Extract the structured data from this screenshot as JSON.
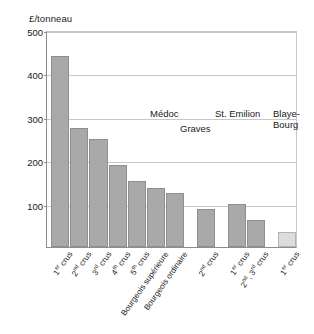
{
  "chart_data": {
    "type": "bar",
    "title": "",
    "ylabel": "£/tonneau",
    "xlabel": "",
    "ylim": [
      0,
      500
    ],
    "yticks": [
      100,
      200,
      300,
      400,
      500
    ],
    "grid": true,
    "legend": "none",
    "categories": [
      "1er crus",
      "2nd crus",
      "3rd crus",
      "4th crus",
      "5th crus",
      "Bourgeois supérieure",
      "Bourgeois ordinaire",
      "2nd crus",
      "1er crus",
      "2nd, 3rd crus",
      "1er crus"
    ],
    "values": [
      440,
      275,
      250,
      190,
      152,
      137,
      125,
      88,
      100,
      62,
      35
    ],
    "groups": [
      {
        "name": "Médoc",
        "bars": 7
      },
      {
        "name": "Graves",
        "bars": 1
      },
      {
        "name": "St. Emilion",
        "bars": 2
      },
      {
        "name": "Blaye-Bourg",
        "bars": 1
      }
    ],
    "annotations": [
      {
        "text": "Médoc"
      },
      {
        "text": "Graves"
      },
      {
        "text": "St. Emilion"
      },
      {
        "text": "Blaye-",
        "text2": "Bourg"
      }
    ]
  },
  "axis": {
    "y_title": "£/tonneau",
    "ticks": [
      "500",
      "400",
      "300",
      "200",
      "100"
    ]
  },
  "annotations": {
    "medoc": "Médoc",
    "graves": "Graves",
    "st_emilion": "St. Emilion",
    "blaye_1": "Blaye-",
    "blaye_2": "Bourg"
  },
  "xlabels": [
    {
      "prefix": "1",
      "sup": "er",
      "suffix": " crus"
    },
    {
      "prefix": "2",
      "sup": "nd",
      "suffix": " crus"
    },
    {
      "prefix": "3",
      "sup": "rd",
      "suffix": " crus"
    },
    {
      "prefix": "4",
      "sup": "th",
      "suffix": " crus"
    },
    {
      "prefix": "5",
      "sup": "th",
      "suffix": " crus"
    },
    {
      "prefix": "Bourgeois supérieure",
      "sup": "",
      "suffix": ""
    },
    {
      "prefix": "Bourgeois ordinaire",
      "sup": "",
      "suffix": ""
    },
    {
      "prefix": "2",
      "sup": "nd",
      "suffix": " crus"
    },
    {
      "prefix": "1",
      "sup": "er",
      "suffix": " crus"
    },
    {
      "prefix": "2",
      "sup": "nd",
      "suffix": ", 3"
    },
    {
      "prefix": "1",
      "sup": "er",
      "suffix": " crus"
    }
  ],
  "xlabel_extra": {
    "sup2": "rd",
    "tail2": " crus"
  },
  "colors": {
    "bar": "#a9a9a9",
    "bar_pale": "#dcdcdc",
    "bar_edge": "#8f8f8f",
    "grid": "#c8c8c8",
    "axis": "#8d8d8d",
    "text": "#1a1a1a"
  }
}
